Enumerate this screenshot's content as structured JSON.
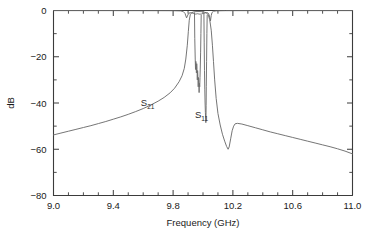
{
  "chart_data": {
    "type": "line",
    "title": "",
    "xlabel": "Frequency (GHz)",
    "ylabel": "dB",
    "xlim": [
      9.0,
      11.0
    ],
    "ylim": [
      -80,
      0
    ],
    "grid": false,
    "legend_position": "inline-annotations",
    "xticks": [
      9.0,
      9.4,
      9.8,
      10.2,
      10.6,
      11.0
    ],
    "xticklabels": [
      "9.0",
      "9.4",
      "9.8",
      "10.2",
      "10.6",
      "11.0"
    ],
    "xminor_step": 0.1,
    "yticks": [
      0,
      -20,
      -40,
      -60,
      -80
    ],
    "yticklabels": [
      "0",
      "-20",
      "-40",
      "-60",
      "-80"
    ],
    "yminor_step": 10,
    "annotations": [
      {
        "text": "S",
        "sub": "21",
        "x": 9.63,
        "y": -41.5,
        "name": "s21-annotation"
      },
      {
        "text": "S",
        "sub": "11",
        "x": 9.99,
        "y": -46.5,
        "name": "s11-annotation"
      }
    ],
    "series": [
      {
        "name": "S21",
        "color": "#6e6e6e",
        "points": [
          [
            9.0,
            -53.8
          ],
          [
            9.05,
            -53.0
          ],
          [
            9.1,
            -52.2
          ],
          [
            9.15,
            -51.4
          ],
          [
            9.2,
            -50.6
          ],
          [
            9.25,
            -49.8
          ],
          [
            9.3,
            -48.9
          ],
          [
            9.35,
            -48.0
          ],
          [
            9.4,
            -47.0
          ],
          [
            9.45,
            -46.0
          ],
          [
            9.5,
            -44.9
          ],
          [
            9.55,
            -43.7
          ],
          [
            9.6,
            -42.4
          ],
          [
            9.65,
            -40.9
          ],
          [
            9.7,
            -39.2
          ],
          [
            9.74,
            -37.6
          ],
          [
            9.78,
            -35.6
          ],
          [
            9.81,
            -33.6
          ],
          [
            9.84,
            -30.8
          ],
          [
            9.86,
            -28.2
          ],
          [
            9.875,
            -25.0
          ],
          [
            9.885,
            -21.0
          ],
          [
            9.895,
            -15.0
          ],
          [
            9.902,
            -9.0
          ],
          [
            9.908,
            -4.2
          ],
          [
            9.915,
            -1.8
          ],
          [
            9.925,
            -0.9
          ],
          [
            9.94,
            -0.55
          ],
          [
            9.96,
            -0.45
          ],
          [
            9.98,
            -0.45
          ],
          [
            10.0,
            -0.55
          ],
          [
            10.02,
            -0.9
          ],
          [
            10.035,
            -1.9
          ],
          [
            10.045,
            -4.0
          ],
          [
            10.055,
            -8.5
          ],
          [
            10.063,
            -15.0
          ],
          [
            10.07,
            -22.0
          ],
          [
            10.078,
            -30.0
          ],
          [
            10.088,
            -38.0
          ],
          [
            10.1,
            -44.5
          ],
          [
            10.115,
            -49.5
          ],
          [
            10.13,
            -53.5
          ],
          [
            10.145,
            -56.5
          ],
          [
            10.158,
            -58.8
          ],
          [
            10.168,
            -60.0
          ],
          [
            10.175,
            -59.0
          ],
          [
            10.185,
            -55.5
          ],
          [
            10.195,
            -52.0
          ],
          [
            10.205,
            -50.0
          ],
          [
            10.215,
            -49.0
          ],
          [
            10.23,
            -48.8
          ],
          [
            10.26,
            -49.1
          ],
          [
            10.3,
            -49.8
          ],
          [
            10.35,
            -50.7
          ],
          [
            10.4,
            -51.6
          ],
          [
            10.45,
            -52.5
          ],
          [
            10.5,
            -53.3
          ],
          [
            10.55,
            -54.1
          ],
          [
            10.6,
            -54.9
          ],
          [
            10.65,
            -55.7
          ],
          [
            10.7,
            -56.5
          ],
          [
            10.75,
            -57.3
          ],
          [
            10.8,
            -58.1
          ],
          [
            10.85,
            -58.9
          ],
          [
            10.9,
            -59.8
          ],
          [
            10.95,
            -60.8
          ],
          [
            11.0,
            -62.0
          ]
        ]
      },
      {
        "name": "S11",
        "color": "#6e6e6e",
        "points": [
          [
            9.0,
            -0.05
          ],
          [
            9.4,
            -0.06
          ],
          [
            9.7,
            -0.08
          ],
          [
            9.8,
            -0.1
          ],
          [
            9.85,
            -0.18
          ],
          [
            9.868,
            -0.45
          ],
          [
            9.88,
            -1.3
          ],
          [
            9.89,
            -3.2
          ],
          [
            9.898,
            -2.0
          ],
          [
            9.905,
            -1.2
          ],
          [
            9.915,
            -0.95
          ],
          [
            9.925,
            -1.0
          ],
          [
            9.935,
            -1.25
          ],
          [
            9.945,
            -1.5
          ],
          [
            9.952,
            -1.55
          ],
          [
            9.958,
            -1.45
          ],
          [
            9.962,
            -1.3
          ],
          [
            9.966,
            -1.55
          ],
          [
            9.97,
            -1.4
          ],
          [
            9.974,
            -1.7
          ],
          [
            9.977,
            -1.45
          ],
          [
            9.98,
            -1.35
          ],
          [
            9.984,
            -1.6
          ],
          [
            9.988,
            -1.45
          ],
          [
            9.992,
            -1.55
          ],
          [
            9.996,
            -1.35
          ],
          [
            10.0,
            -1.5
          ],
          [
            10.004,
            -1.3
          ],
          [
            10.01,
            -1.15
          ],
          [
            10.018,
            -1.0
          ],
          [
            10.026,
            -0.9
          ],
          [
            10.034,
            -1.1
          ],
          [
            10.042,
            -2.0
          ],
          [
            10.05,
            -4.5
          ],
          [
            10.055,
            -2.2
          ],
          [
            10.06,
            -0.9
          ],
          [
            10.07,
            -0.35
          ],
          [
            10.09,
            -0.15
          ],
          [
            10.15,
            -0.08
          ],
          [
            10.4,
            -0.06
          ],
          [
            10.7,
            -0.05
          ],
          [
            11.0,
            -0.05
          ]
        ]
      },
      {
        "name": "S11-ripple-spike-A",
        "color": "#6e6e6e",
        "points": [
          [
            9.943,
            -1.0
          ],
          [
            9.945,
            -12.0
          ],
          [
            9.948,
            -21.0
          ],
          [
            9.95,
            -25.5
          ],
          [
            9.952,
            -22.0
          ],
          [
            9.954,
            -24.0
          ],
          [
            9.956,
            -27.0
          ],
          [
            9.958,
            -23.0
          ],
          [
            9.96,
            -25.5
          ],
          [
            9.962,
            -30.0
          ],
          [
            9.964,
            -26.0
          ],
          [
            9.966,
            -28.5
          ],
          [
            9.968,
            -33.0
          ],
          [
            9.97,
            -29.0
          ],
          [
            9.972,
            -31.0
          ],
          [
            9.974,
            -35.5
          ],
          [
            9.976,
            -31.5
          ],
          [
            9.978,
            -33.0
          ],
          [
            9.98,
            -29.0
          ],
          [
            9.982,
            -24.0
          ],
          [
            9.984,
            -18.0
          ],
          [
            9.986,
            -10.0
          ],
          [
            9.988,
            -2.0
          ]
        ]
      },
      {
        "name": "S11-ripple-spike-B",
        "color": "#6e6e6e",
        "points": [
          [
            10.006,
            -1.2
          ],
          [
            10.008,
            -14.0
          ],
          [
            10.01,
            -26.0
          ],
          [
            10.012,
            -34.0
          ],
          [
            10.014,
            -40.0
          ],
          [
            10.016,
            -44.0
          ],
          [
            10.018,
            -47.0
          ],
          [
            10.019,
            -48.5
          ],
          [
            10.02,
            -46.0
          ],
          [
            10.021,
            -41.0
          ],
          [
            10.022,
            -33.0
          ],
          [
            10.024,
            -22.0
          ],
          [
            10.026,
            -10.0
          ],
          [
            10.028,
            -2.0
          ]
        ]
      }
    ]
  },
  "axes": {
    "x_title": "Frequency (GHz)",
    "y_title": "dB"
  }
}
